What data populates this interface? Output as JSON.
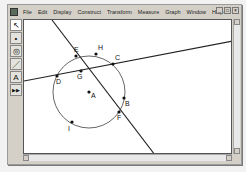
{
  "menubar": {
    "items": [
      "File",
      "Edit",
      "Display",
      "Construct",
      "Transform",
      "Measure",
      "Graph",
      "Window",
      "Help"
    ]
  },
  "window_controls": {
    "minimize": "_",
    "maximize": "□",
    "close": "×"
  },
  "toolbox": {
    "tools": [
      {
        "name": "arrow-tool",
        "glyph": "↖"
      },
      {
        "name": "point-tool",
        "glyph": "•"
      },
      {
        "name": "compass-tool",
        "glyph": "◎"
      },
      {
        "name": "straightedge-tool",
        "glyph": "／"
      },
      {
        "name": "text-tool",
        "glyph": "A"
      },
      {
        "name": "custom-tool",
        "glyph": "▶▶"
      }
    ]
  },
  "figure": {
    "circle": {
      "center": "A",
      "cx": 65,
      "cy": 72,
      "r": 36
    },
    "points": [
      {
        "label": "A",
        "x": 65,
        "y": 72,
        "lx": 67,
        "ly": 78
      },
      {
        "label": "B",
        "x": 100,
        "y": 78,
        "lx": 101,
        "ly": 86
      },
      {
        "label": "C",
        "x": 89,
        "y": 44,
        "lx": 91,
        "ly": 40
      },
      {
        "label": "D",
        "x": 33,
        "y": 56,
        "lx": 32,
        "ly": 64
      },
      {
        "label": "E",
        "x": 52,
        "y": 36,
        "lx": 50,
        "ly": 32
      },
      {
        "label": "F",
        "x": 95,
        "y": 92,
        "lx": 93,
        "ly": 100
      },
      {
        "label": "G",
        "x": 57,
        "y": 51,
        "lx": 53,
        "ly": 59
      },
      {
        "label": "H",
        "x": 72,
        "y": 34,
        "lx": 74,
        "ly": 30
      },
      {
        "label": "I",
        "x": 48,
        "y": 102,
        "lx": 44,
        "ly": 111
      }
    ],
    "lines": [
      {
        "name": "line-through-E-F",
        "x1": 28,
        "y1": 0,
        "x2": 131,
        "y2": 135
      },
      {
        "name": "line-through-D-C",
        "x1": 0,
        "y1": 61,
        "x2": 209,
        "y2": 21
      }
    ]
  }
}
